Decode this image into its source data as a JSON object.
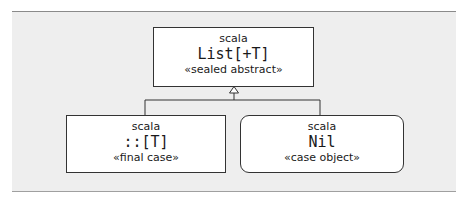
{
  "diagram": {
    "type": "uml-class-hierarchy",
    "colors": {
      "panel_background": "#eeeeee",
      "box_background": "#ffffff",
      "stroke": "#333333"
    },
    "parent": {
      "package": "scala",
      "name": "List[+T]",
      "stereotype": "«sealed abstract»",
      "shape": "rectangle"
    },
    "children": [
      {
        "package": "scala",
        "name": "::[T]",
        "stereotype": "«final case»",
        "shape": "rectangle"
      },
      {
        "package": "scala",
        "name": "Nil",
        "stereotype": "«case object»",
        "shape": "rounded-rectangle"
      }
    ],
    "relationship": "inheritance (hollow triangle arrow from children to parent)"
  }
}
